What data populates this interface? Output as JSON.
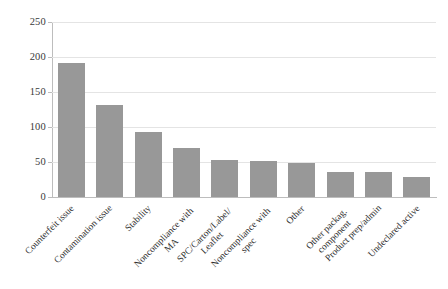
{
  "chart_data": {
    "type": "bar",
    "title": "",
    "subtitle": "",
    "xlabel": "",
    "ylabel": "",
    "ylim": [
      0,
      250
    ],
    "yticks": [
      0,
      50,
      100,
      150,
      200,
      250
    ],
    "ytick_labels": [
      "0",
      "50",
      "100",
      "150",
      "200",
      "250"
    ],
    "grid": true,
    "legend": false,
    "legend_position": "none",
    "bar_color": "#989898",
    "categories": [
      "Counterfeit issue",
      "Contamination issue",
      "Stability",
      "Noncompliance with MA",
      "SPC/Carton/Label/ Leaflet",
      "Noncompliance with spec",
      "Other",
      "Other packag. component",
      "Product prep/admin",
      "Undeclared active"
    ],
    "category_lines": [
      [
        "Counterfeit issue"
      ],
      [
        "Contamination issue"
      ],
      [
        "Stability"
      ],
      [
        "Noncompliance with",
        "MA"
      ],
      [
        "SPC/Carton/Label/",
        "Leaflet"
      ],
      [
        "Noncompliance with",
        "spec"
      ],
      [
        "Other"
      ],
      [
        "Other packag.",
        "component"
      ],
      [
        "Product prep/admin"
      ],
      [
        "Undeclared active"
      ]
    ],
    "values": [
      192,
      131,
      93,
      70,
      53,
      51,
      49,
      36,
      36,
      28
    ]
  },
  "axes": {
    "y_axis_name": "y-axis",
    "x_axis_name": "x-axis"
  }
}
